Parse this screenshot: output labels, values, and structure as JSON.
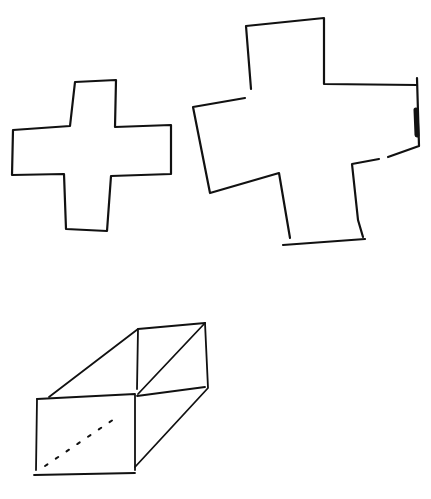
{
  "canvas": {
    "width": 431,
    "height": 499,
    "background": "#ffffff",
    "ink": "#111111"
  },
  "figures": [
    {
      "name": "small-cross",
      "type": "hand-drawn plus shape"
    },
    {
      "name": "large-cross",
      "type": "hand-drawn plus shape, slightly rotated, open gaps"
    },
    {
      "name": "open-box",
      "type": "hand-drawn rectangular prism in perspective with dashed hidden edge"
    }
  ]
}
